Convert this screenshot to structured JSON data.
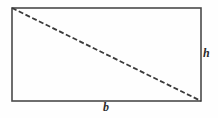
{
  "figure": {
    "name": "rectangle-with-diagonal",
    "background_color": "#fefefe",
    "stroke_color": "#4a4a4a",
    "diagonal_color": "#3a3a3a",
    "label_color": "#2b2b2b",
    "rectangle": {
      "x": 12,
      "y": 8,
      "width": 189,
      "height": 93,
      "stroke_width": 1.6
    },
    "diagonal": {
      "x1": 12,
      "y1": 8,
      "x2": 201,
      "y2": 101,
      "stroke_width": 1.8,
      "dash_pattern": "5,2.5",
      "style": "dashed"
    },
    "labels": {
      "height": "h",
      "base": "b"
    }
  }
}
